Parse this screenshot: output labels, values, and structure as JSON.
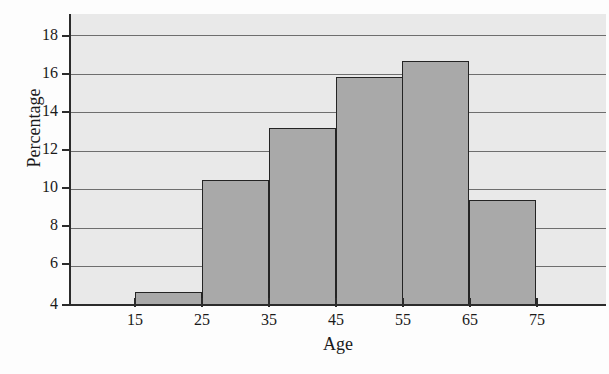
{
  "chart_data": {
    "type": "bar",
    "title": "",
    "subtitle": "",
    "xlabel": "Age",
    "ylabel": "Percentage",
    "categories": [
      "15-25",
      "25-35",
      "35-45",
      "45-55",
      "55-65",
      "65-75"
    ],
    "bin_edges": [
      15,
      25,
      35,
      45,
      55,
      65,
      75
    ],
    "values": [
      4.7,
      10.5,
      13.2,
      15.8,
      16.65,
      9.45
    ],
    "x_tick_labels": [
      "15",
      "25",
      "35",
      "45",
      "55",
      "65",
      "75"
    ],
    "y_tick_labels": [
      "4",
      "6",
      "8",
      "10",
      "12",
      "14",
      "16",
      "18"
    ],
    "y_ticks": [
      4,
      6,
      8,
      10,
      12,
      14,
      16,
      18
    ],
    "xlim": [
      5,
      85
    ],
    "ylim": [
      4,
      19
    ],
    "grid": "horizontal",
    "legend": "none",
    "bar_fill_color": "#a9a9a9",
    "bar_edge_color": "#242424",
    "plot_background_color": "#e9e9e9",
    "gridline_color": "#6e6e6e",
    "axis_color": "#2b2b2b"
  }
}
